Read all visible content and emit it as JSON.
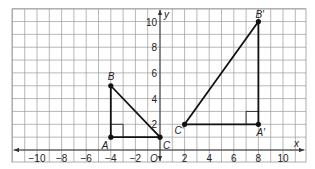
{
  "diagram": {
    "type": "coordinate-plane",
    "grid": {
      "x_min": -12,
      "x_max": 12,
      "y_min": -1,
      "y_max": 11,
      "step": 1
    },
    "axes": {
      "x_label": "x",
      "y_label": "y",
      "origin_label": "O",
      "x_ticks": [
        -10,
        -8,
        -6,
        -4,
        -2,
        2,
        4,
        6,
        8,
        10
      ],
      "x_tick_labels": [
        "−10",
        "−8",
        "−6",
        "−4",
        "−2",
        "2",
        "4",
        "6",
        "8",
        "10"
      ],
      "y_ticks": [
        2,
        4,
        6,
        8,
        10
      ],
      "y_tick_labels": [
        "2",
        "4",
        "6",
        "8",
        "10"
      ]
    },
    "triangles": [
      {
        "name": "ABC",
        "vertices": [
          {
            "label": "A",
            "x": -4,
            "y": 1
          },
          {
            "label": "B",
            "x": -4,
            "y": 5
          },
          {
            "label": "C",
            "x": 0,
            "y": 1
          }
        ],
        "right_angle_at": "A"
      },
      {
        "name": "A'B'C'",
        "vertices": [
          {
            "label": "A′",
            "x": 8,
            "y": 2
          },
          {
            "label": "B′",
            "x": 8,
            "y": 10
          },
          {
            "label": "C′",
            "x": 2,
            "y": 2
          }
        ],
        "right_angle_at": "A′"
      }
    ],
    "colors": {
      "grid": "#9a9a9a",
      "axis": "#333333",
      "triangle": "#111111",
      "background": "#ffffff"
    }
  }
}
